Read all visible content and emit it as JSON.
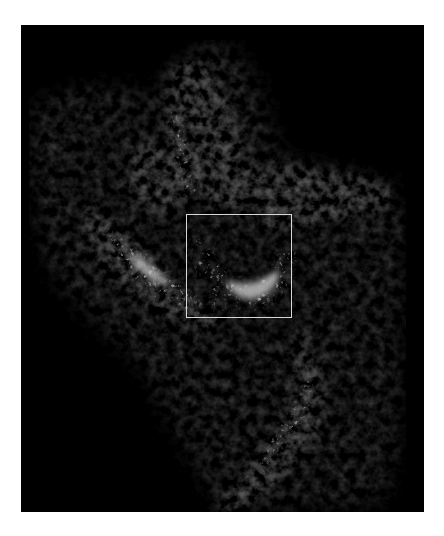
{
  "image": {
    "description": "Grayscale intensity map of a diffuse nebula-like structure on black background",
    "colormap": "grayscale",
    "background_color": "#000000",
    "page_color": "#ffffff"
  },
  "overlay": {
    "roi_label": "Region of interest",
    "roi_color": "#d8d8d8"
  },
  "features": [
    {
      "name": "northern-filament",
      "brightness": "medium"
    },
    {
      "name": "central-ridge",
      "brightness": "high"
    },
    {
      "name": "western-arm",
      "brightness": "high"
    },
    {
      "name": "eastern-extension",
      "brightness": "medium"
    },
    {
      "name": "southern-filament",
      "brightness": "medium-high"
    }
  ]
}
